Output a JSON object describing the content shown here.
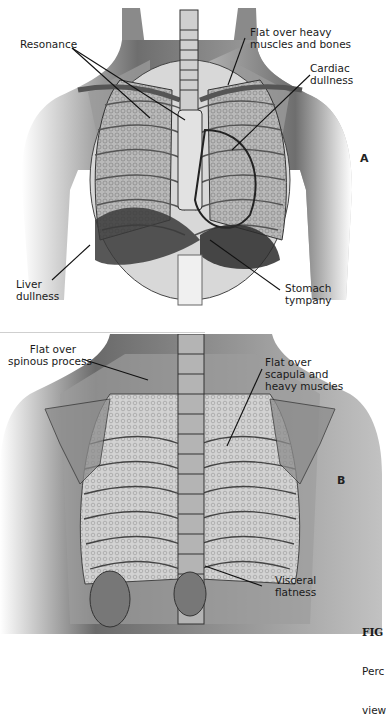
{
  "figure": {
    "caption_label": "FIG",
    "caption_line2": "Perc",
    "caption_line3": "view"
  },
  "panel_a": {
    "letter": "A",
    "view": "anterior chest",
    "labels": [
      {
        "id": "resonance",
        "text": "Resonance"
      },
      {
        "id": "flat-heavy-muscles-bones",
        "text": "Flat over heavy\nmuscles and bones"
      },
      {
        "id": "cardiac-dullness",
        "text": "Cardiac\ndullness"
      },
      {
        "id": "liver-dullness",
        "text": "Liver\ndullness"
      },
      {
        "id": "stomach-tympany",
        "text": "Stomach\ntympany"
      }
    ]
  },
  "panel_b": {
    "letter": "B",
    "view": "posterior chest",
    "labels": [
      {
        "id": "flat-spinous-process",
        "text": "Flat over\nspinous process"
      },
      {
        "id": "flat-scapula-muscles",
        "text": "Flat over\nscapula and\nheavy muscles"
      },
      {
        "id": "visceral-flatness",
        "text": "Visceral\nflatness"
      }
    ]
  },
  "colors": {
    "skin_shade": "#9a9a9a",
    "overlay_gray": "#8c8c8c",
    "lung_texture": "#c8c8c8",
    "dark_organ": "#3a3a3a",
    "line": "#111111"
  }
}
